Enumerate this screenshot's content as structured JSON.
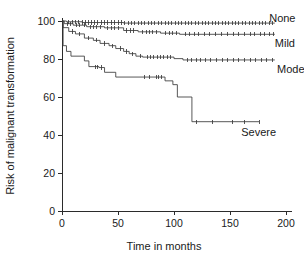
{
  "chart_data": {
    "type": "line",
    "plot_kind": "kaplan-meier-step",
    "title": "",
    "xlabel": "Time in months",
    "ylabel": "Risk of malignant transformation",
    "xlim": [
      0,
      200
    ],
    "ylim": [
      0,
      100
    ],
    "xticks": [
      0,
      50,
      100,
      150,
      200
    ],
    "yticks": [
      0,
      20,
      40,
      60,
      80,
      100
    ],
    "xtick_labels": [
      "0",
      "50",
      "100",
      "150",
      "200"
    ],
    "ytick_labels": [
      "0",
      "20",
      "40",
      "60",
      "80",
      "100"
    ],
    "grid": false,
    "legend_position": "inline-right-of-curve-ends",
    "line_color": "#3a3a3a",
    "axis_color": "#2b2b2b",
    "series": [
      {
        "name": "None",
        "label": "None",
        "label_x": 185,
        "label_y": 101.5,
        "final_value": 99,
        "steps": [
          [
            0,
            100
          ],
          [
            4,
            100
          ],
          [
            4,
            99.6
          ],
          [
            18,
            99.6
          ],
          [
            18,
            99.2
          ],
          [
            55,
            99.2
          ],
          [
            55,
            98.9
          ],
          [
            190,
            98.9
          ]
        ],
        "censor_times": [
          6,
          9,
          12,
          15,
          18,
          21,
          24,
          26,
          29,
          32,
          35,
          38,
          41,
          44,
          47,
          50,
          53,
          56,
          59,
          62,
          65,
          68,
          71,
          74,
          77,
          80,
          83,
          86,
          89,
          92,
          95,
          98,
          101,
          104,
          107,
          110,
          113,
          116,
          119,
          122,
          125,
          128,
          131,
          134,
          137,
          140,
          143,
          146,
          149,
          152,
          155,
          158,
          161,
          164,
          167,
          170,
          173,
          176,
          179,
          182,
          185,
          188
        ]
      },
      {
        "name": "Mild",
        "label": "Mild",
        "label_x": 190,
        "label_y": 88.5,
        "final_value": 93,
        "steps": [
          [
            0,
            100
          ],
          [
            2,
            100
          ],
          [
            2,
            98.6
          ],
          [
            10,
            98.6
          ],
          [
            10,
            97.8
          ],
          [
            22,
            97.8
          ],
          [
            22,
            97.0
          ],
          [
            38,
            97.0
          ],
          [
            38,
            96.4
          ],
          [
            55,
            96.4
          ],
          [
            55,
            95.0
          ],
          [
            68,
            95.0
          ],
          [
            68,
            94.3
          ],
          [
            88,
            94.3
          ],
          [
            88,
            93.6
          ],
          [
            105,
            93.6
          ],
          [
            105,
            93.0
          ],
          [
            190,
            93.0
          ]
        ],
        "censor_times": [
          5,
          8,
          13,
          16,
          20,
          25,
          28,
          31,
          34,
          41,
          44,
          47,
          50,
          58,
          61,
          64,
          72,
          75,
          78,
          81,
          84,
          92,
          96,
          99,
          102,
          110,
          114,
          118,
          122,
          127,
          132,
          137,
          142,
          148,
          153,
          158,
          163,
          168,
          172,
          177,
          181,
          185,
          189
        ]
      },
      {
        "name": "Moderate",
        "label": "Moderate",
        "label_x": 192,
        "label_y": 74.5,
        "final_value": 79.5,
        "steps": [
          [
            0,
            100
          ],
          [
            1,
            100
          ],
          [
            1,
            96.5
          ],
          [
            6,
            96.5
          ],
          [
            6,
            94.5
          ],
          [
            12,
            94.5
          ],
          [
            12,
            93.2
          ],
          [
            20,
            93.2
          ],
          [
            20,
            91.0
          ],
          [
            28,
            91.0
          ],
          [
            28,
            89.8
          ],
          [
            34,
            89.8
          ],
          [
            34,
            88.2
          ],
          [
            42,
            88.2
          ],
          [
            42,
            87.0
          ],
          [
            48,
            87.0
          ],
          [
            48,
            85.5
          ],
          [
            55,
            85.5
          ],
          [
            55,
            84.0
          ],
          [
            60,
            84.0
          ],
          [
            60,
            82.8
          ],
          [
            66,
            82.8
          ],
          [
            66,
            81.5
          ],
          [
            72,
            81.5
          ],
          [
            72,
            81.0
          ],
          [
            100,
            81.0
          ],
          [
            100,
            80.2
          ],
          [
            108,
            80.2
          ],
          [
            108,
            79.5
          ],
          [
            190,
            79.5
          ]
        ],
        "censor_times": [
          9,
          16,
          24,
          31,
          38,
          45,
          52,
          58,
          63,
          70,
          76,
          79,
          82,
          85,
          88,
          91,
          94,
          97,
          112,
          116,
          120,
          124,
          128,
          133,
          138,
          143,
          148,
          153,
          158,
          163,
          168,
          173,
          178,
          183,
          188
        ]
      },
      {
        "name": "Severe",
        "label": "Severe",
        "label_x": 160,
        "label_y": 41.5,
        "final_value": 47,
        "steps": [
          [
            0,
            100
          ],
          [
            1,
            100
          ],
          [
            1,
            87.0
          ],
          [
            4,
            87.0
          ],
          [
            4,
            84.0
          ],
          [
            8,
            84.0
          ],
          [
            8,
            81.5
          ],
          [
            20,
            81.5
          ],
          [
            20,
            79.0
          ],
          [
            24,
            79.0
          ],
          [
            24,
            76.0
          ],
          [
            33,
            76.0
          ],
          [
            33,
            75.5
          ],
          [
            38,
            75.5
          ],
          [
            38,
            73.0
          ],
          [
            48,
            73.0
          ],
          [
            48,
            70.5
          ],
          [
            92,
            70.5
          ],
          [
            92,
            68.5
          ],
          [
            99,
            68.5
          ],
          [
            99,
            66.5
          ],
          [
            103,
            66.5
          ],
          [
            103,
            60.0
          ],
          [
            116,
            60.0
          ],
          [
            116,
            47.0
          ],
          [
            176,
            47.0
          ]
        ],
        "censor_times": [
          30,
          32,
          35,
          74,
          78,
          84,
          86,
          89,
          120,
          134,
          152,
          163,
          176
        ]
      }
    ]
  }
}
